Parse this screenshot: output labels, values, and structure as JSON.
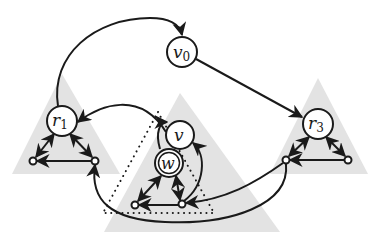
{
  "figure": {
    "type": "graph-diagram",
    "background": "#ffffff",
    "colors": {
      "edge": "#1a1a1a",
      "subtree_fill": "#e3e3e3",
      "node_fill": "#ffffff",
      "gray_arrow": "#8a8a8a"
    },
    "nodes": [
      {
        "id": "v0",
        "label": "v",
        "sub": "0",
        "x": 182,
        "y": 52,
        "r": 15,
        "style": "circle"
      },
      {
        "id": "r1",
        "label": "r",
        "sub": "1",
        "x": 62,
        "y": 121,
        "r": 15,
        "style": "circle"
      },
      {
        "id": "v",
        "label": "v",
        "sub": "",
        "x": 180,
        "y": 135,
        "r": 14,
        "style": "circle"
      },
      {
        "id": "r3",
        "label": "r",
        "sub": "3",
        "x": 318,
        "y": 124,
        "r": 15,
        "style": "circle"
      },
      {
        "id": "w",
        "label": "w",
        "sub": "",
        "x": 169,
        "y": 163,
        "r": 14,
        "style": "double-circle"
      }
    ],
    "small_nodes": [
      {
        "id": "r1_left",
        "x": 33,
        "y": 161
      },
      {
        "id": "r1_right",
        "x": 95,
        "y": 161
      },
      {
        "id": "w_left",
        "x": 135,
        "y": 205
      },
      {
        "id": "w_right",
        "x": 182,
        "y": 204
      },
      {
        "id": "r3_left",
        "x": 286,
        "y": 160
      },
      {
        "id": "r3_right",
        "x": 348,
        "y": 160
      }
    ],
    "subtrees": [
      {
        "id": "tri_r1",
        "points": "62,74 12,174 120,174"
      },
      {
        "id": "tri_v",
        "points": "180,93 104,232 280,232"
      },
      {
        "id": "tri_r3",
        "points": "318,78 270,174 368,174"
      }
    ],
    "dotted_region": {
      "points": "158,112 103,213 214,213"
    },
    "edges": [
      {
        "from": "r1",
        "to": "v0",
        "kind": "curved",
        "arrow": "end"
      },
      {
        "from": "v0",
        "to": "r3",
        "kind": "straight",
        "arrow": "end"
      },
      {
        "from": "v",
        "to": "r1",
        "kind": "curved",
        "arrow": "end"
      },
      {
        "from": "w",
        "to": "v",
        "kind": "curved",
        "arrow": "end"
      },
      {
        "from": "w_right",
        "to": "v",
        "kind": "curved",
        "arrow": "end"
      },
      {
        "from": "r3_left",
        "to": "w_right",
        "kind": "curved",
        "arrow": "end"
      },
      {
        "from": "r3_left",
        "to": "r1_right",
        "kind": "long-curve",
        "arrow": "end"
      }
    ]
  }
}
